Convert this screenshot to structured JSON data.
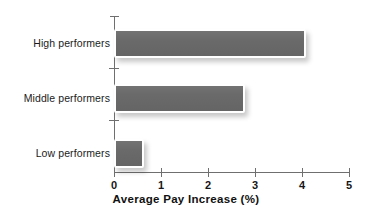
{
  "chart_data": {
    "type": "bar",
    "orientation": "horizontal",
    "title": "",
    "xlabel": "Average Pay Increase (%)",
    "ylabel": "",
    "categories": [
      "High performers",
      "Middle performers",
      "Low performers"
    ],
    "values": [
      4.0,
      2.7,
      0.55
    ],
    "series": [
      {
        "name": "Average Pay Increase (%)",
        "values": [
          4.0,
          2.7,
          0.55
        ]
      }
    ],
    "xlim": [
      0,
      5
    ],
    "xticks": [
      0,
      1,
      2,
      3,
      4,
      5
    ],
    "xtick_labels": [
      "0",
      "1",
      "2",
      "3",
      "4",
      "5"
    ],
    "grid": false,
    "legend": false,
    "legend_position": "none",
    "bar_color": "#6a6a6a",
    "bar_outline_color": "#ffffff",
    "axis_color": "#6f6f6f",
    "background_color": "#ffffff"
  },
  "axis": {
    "x_title": "Average Pay Increase (%)",
    "tick_labels": [
      "0",
      "1",
      "2",
      "3",
      "4",
      "5"
    ]
  },
  "bars": [
    {
      "label": "High performers",
      "value": 4.0
    },
    {
      "label": "Middle performers",
      "value": 2.7
    },
    {
      "label": "Low performers",
      "value": 0.55
    }
  ]
}
